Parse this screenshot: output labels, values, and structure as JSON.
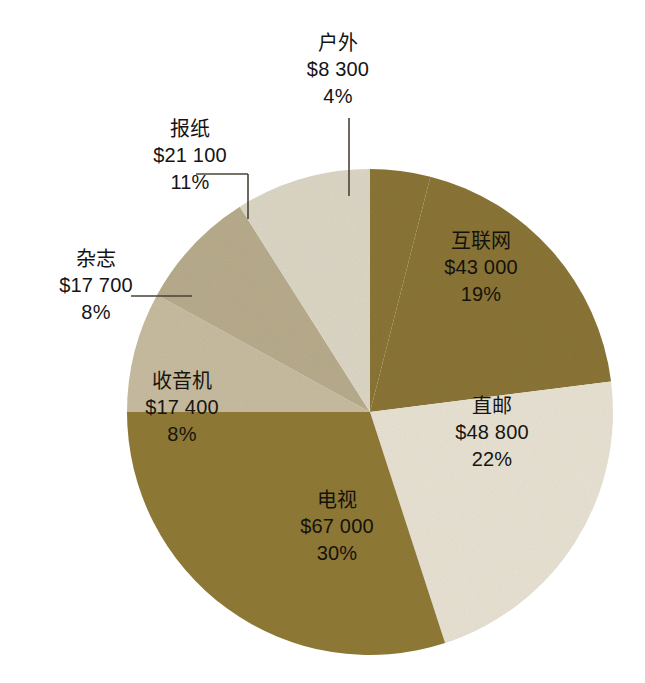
{
  "chart_data": {
    "type": "pie",
    "title": "",
    "subtitle": "",
    "xlabel": "",
    "ylabel": "",
    "legend_position": "none",
    "grid": false,
    "currency_symbol": "$",
    "total_value": 223300,
    "categories": [
      "户外",
      "互联网",
      "直邮",
      "电视",
      "收音机",
      "杂志",
      "报纸"
    ],
    "values": [
      8300,
      48800,
      43000,
      67000,
      17400,
      17700,
      21100
    ],
    "percents": [
      4,
      19,
      22,
      30,
      8,
      8,
      11
    ],
    "slices": [
      {
        "name": "户外",
        "value": 8300,
        "value_label": "$8 300",
        "percent": 4,
        "percent_label": "4%",
        "color": "#8a7435",
        "label_placement": "outside",
        "start_angle": 0,
        "end_angle": 14.4,
        "leader": "vertical"
      },
      {
        "name": "互联网",
        "value": 43000,
        "value_label": "$43 000",
        "percent": 19,
        "percent_label": "19%",
        "color": "#8a7435",
        "label_placement": "inside",
        "start_angle": 14.4,
        "end_angle": 82.8,
        "leader": "none"
      },
      {
        "name": "直邮",
        "value": 48800,
        "value_label": "$48 800",
        "percent": 22,
        "percent_label": "22%",
        "color": "#e7e1d2",
        "label_placement": "inside",
        "start_angle": 82.8,
        "end_angle": 162.0,
        "leader": "none"
      },
      {
        "name": "电视",
        "value": 67000,
        "value_label": "$67 000",
        "percent": 30,
        "percent_label": "30%",
        "color": "#8f7936",
        "label_placement": "inside",
        "start_angle": 162.0,
        "end_angle": 270.0,
        "leader": "none"
      },
      {
        "name": "收音机",
        "value": 17400,
        "value_label": "$17 400",
        "percent": 8,
        "percent_label": "8%",
        "color": "#c6bb9f",
        "label_placement": "inside",
        "start_angle": 270.0,
        "end_angle": 298.8,
        "leader": "none"
      },
      {
        "name": "杂志",
        "value": 17700,
        "value_label": "$17 700",
        "percent": 8,
        "percent_label": "8%",
        "color": "#b7ab8c",
        "label_placement": "outside",
        "start_angle": 298.8,
        "end_angle": 327.6,
        "leader": "horizontal"
      },
      {
        "name": "报纸",
        "value": 21100,
        "value_label": "$21 100",
        "percent": 11,
        "percent_label": "11%",
        "color": "#dbd5c4",
        "label_placement": "outside",
        "start_angle": 327.6,
        "end_angle": 360.0,
        "leader": "elbow"
      }
    ],
    "geometry": {
      "center_x": 370,
      "center_y": 412,
      "radius": 243
    },
    "palette": {
      "dark_olive": "#8a7435",
      "olive": "#8f7936",
      "cream": "#e7e1d2",
      "light_cream": "#dbd5c4",
      "taupe": "#b7ab8c",
      "light_taupe": "#c6bb9f",
      "leader_line": "#4a4336",
      "text": "#141414",
      "background": "#ffffff"
    }
  }
}
